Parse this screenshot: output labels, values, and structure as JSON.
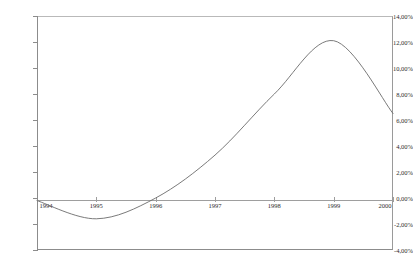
{
  "chart_data": {
    "type": "line",
    "title": "",
    "subtitle": "",
    "xlabel": "",
    "ylabel": "",
    "categories": [
      "1994",
      "1995",
      "1996",
      "1997",
      "1998",
      "1999",
      "2000"
    ],
    "x": [
      1994,
      1995,
      1996,
      1997,
      1998,
      1999,
      2000
    ],
    "values": [
      -0.2,
      -1.6,
      0.0,
      3.3,
      8.0,
      12.1,
      6.5
    ],
    "series": [
      {
        "name": "",
        "values": [
          -0.2,
          -1.6,
          0.0,
          3.3,
          8.0,
          12.1,
          6.5
        ]
      }
    ],
    "value_format": "percent",
    "decimal_separator": ",",
    "ylim": [
      -4.0,
      14.0
    ],
    "ytick_values": [
      14.0,
      12.0,
      10.0,
      8.0,
      6.0,
      4.0,
      2.0,
      0.0,
      -2.0,
      -4.0
    ],
    "ytick_labels": [
      "14,00%",
      "12,00%",
      "10,00%",
      "8,00%",
      "6,00%",
      "4,00%",
      "2,00%",
      "0,00%",
      "-2,00%",
      "-4,00%"
    ],
    "xlim": [
      1994,
      2000
    ],
    "grid": false,
    "legend": false,
    "legend_position": "none",
    "line_color": "#6b6b6b",
    "axis_color": "#8c8c8c",
    "frame_color": "#9a9a9a",
    "text_color": "#2b2b2b",
    "background_color": "#ffffff",
    "smoothing": "spline",
    "annotations": []
  },
  "axes": {
    "y": {
      "ticks": [
        {
          "label": "14,00%",
          "value": 14.0
        },
        {
          "label": "12,00%",
          "value": 12.0
        },
        {
          "label": "10,00%",
          "value": 10.0
        },
        {
          "label": "8,00%",
          "value": 8.0
        },
        {
          "label": "6,00%",
          "value": 6.0
        },
        {
          "label": "4,00%",
          "value": 4.0
        },
        {
          "label": "2,00%",
          "value": 2.0
        },
        {
          "label": "0,00%",
          "value": 0.0
        },
        {
          "label": "-2,00%",
          "value": -2.0
        },
        {
          "label": "-4,00%",
          "value": -4.0
        }
      ]
    },
    "x": {
      "ticks": [
        {
          "label": "1994",
          "value": 1994
        },
        {
          "label": "1995",
          "value": 1995
        },
        {
          "label": "1996",
          "value": 1996
        },
        {
          "label": "1997",
          "value": 1997
        },
        {
          "label": "1998",
          "value": 1998
        },
        {
          "label": "1999",
          "value": 1999
        },
        {
          "label": "2000",
          "value": 2000
        }
      ]
    }
  }
}
